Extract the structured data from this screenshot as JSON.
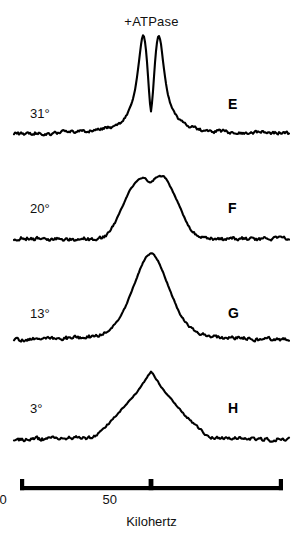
{
  "figure": {
    "title": "+ATPase",
    "width": 303,
    "height": 539
  },
  "panels": [
    {
      "letter": "E",
      "temperature": "31°",
      "baseline_y": 134,
      "peak_shape": "split-doublet",
      "peak_height": 96,
      "peak_width": 26,
      "label_x": 30,
      "label_y": 106,
      "letter_x": 228,
      "letter_y": 96
    },
    {
      "letter": "F",
      "temperature": "20°",
      "baseline_y": 239,
      "peak_shape": "broad-flat-top",
      "peak_height": 62,
      "peak_width": 42,
      "label_x": 30,
      "label_y": 201,
      "letter_x": 228,
      "letter_y": 200
    },
    {
      "letter": "G",
      "temperature": "13°",
      "baseline_y": 340,
      "peak_shape": "rounded-single",
      "peak_height": 84,
      "peak_width": 40,
      "label_x": 30,
      "label_y": 306,
      "letter_x": 228,
      "letter_y": 305
    },
    {
      "letter": "H",
      "temperature": "3°",
      "baseline_y": 440,
      "peak_shape": "sharp-triangular",
      "peak_height": 64,
      "peak_width": 54,
      "label_x": 30,
      "label_y": 401,
      "letter_x": 228,
      "letter_y": 400
    }
  ],
  "axis": {
    "title": "Kilohertz",
    "ticks": [
      {
        "label": "−50",
        "value": -50,
        "x": 48
      },
      {
        "label": "0",
        "value": 0,
        "x": 151
      },
      {
        "label": "50",
        "value": 50,
        "x": 254
      }
    ],
    "range": [
      -62,
      62
    ],
    "bar_left": 20,
    "bar_right": 283,
    "bar_y": 16
  },
  "chart_data": {
    "type": "line",
    "title": "+ATPase",
    "xlabel": "Kilohertz",
    "ylabel": "",
    "xlim": [
      -62,
      62
    ],
    "grid": false,
    "legend": "none",
    "tick_labels": [
      "−50",
      "0",
      "50"
    ],
    "tick_values": [
      -50,
      0,
      50
    ],
    "series": [
      {
        "name": "E",
        "annotation": "31°",
        "description": "Narrow split doublet centered at 0 kHz with two sharp maxima",
        "peak_center": 0,
        "peak_height_rel": 1.0,
        "fwhm_khz": 9,
        "split": true,
        "split_separation_khz": 3.5
      },
      {
        "name": "F",
        "annotation": "20°",
        "description": "Broader peak with slightly flattened, notched top",
        "peak_center": 0,
        "peak_height_rel": 0.65,
        "fwhm_khz": 14,
        "split": false
      },
      {
        "name": "G",
        "annotation": "13°",
        "description": "Single rounded peak, moderately broad",
        "peak_center": 0,
        "peak_height_rel": 0.87,
        "fwhm_khz": 13,
        "split": false
      },
      {
        "name": "H",
        "annotation": "3°",
        "description": "Broad sharp-apex triangular peak",
        "peak_center": 0,
        "peak_height_rel": 0.67,
        "fwhm_khz": 20,
        "split": false
      }
    ]
  }
}
